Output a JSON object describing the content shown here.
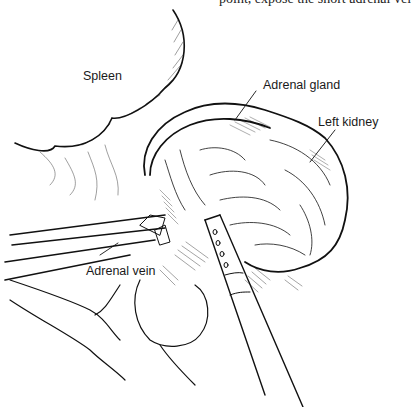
{
  "caption": {
    "text": "point, expose the short adrenal vei"
  },
  "labels": {
    "spleen": "Spleen",
    "adrenal_gland": "Adrenal gland",
    "left_kidney": "Left kidney",
    "adrenal_vein": "Adrenal vein"
  },
  "colors": {
    "ink": "#111111",
    "paper": "#ffffff"
  }
}
